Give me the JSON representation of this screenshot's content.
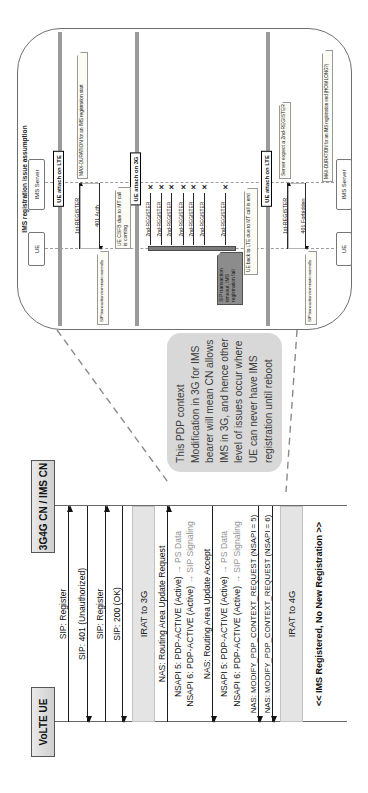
{
  "colors": {
    "callout_bg": "#d8d8d8",
    "band_bg": "#e4e4e4",
    "phase_bar": "#9a9a9a",
    "dark_note_bg": "#8c8c8c",
    "note_bg": "#fcfcf4",
    "text": "#111111",
    "muted_text": "#939393"
  },
  "main": {
    "participants": [
      {
        "label": "VoLTE UE"
      },
      {
        "label": "3G4G CN / IMS CN"
      }
    ],
    "messages": [
      {
        "label": "SIP: Register",
        "dir": "right",
        "type": "arrow"
      },
      {
        "label": "SIP: 401 (Unauthorized)",
        "dir": "left",
        "type": "arrow"
      },
      {
        "label": "SIP: Register",
        "dir": "right",
        "type": "arrow"
      },
      {
        "label": "SIP: 200 (OK)",
        "dir": "left",
        "type": "arrow"
      },
      {
        "label": "IRAT to 3G",
        "type": "band"
      },
      {
        "label": "NAS: Routing Area Update Request",
        "dir": "right",
        "type": "arrow"
      },
      {
        "label": "NSAPI 5: PDP-ACTIVE (Active)",
        "suffix": "→ PS Data",
        "type": "text"
      },
      {
        "label": "NSAPI 6: PDP-ACTIVE (Active)",
        "suffix": "→ SIP Signaling",
        "type": "text"
      },
      {
        "label": "NAS: Routing Area Update Accept",
        "dir": "left",
        "type": "arrow"
      },
      {
        "label": "NSAPI 5: PDP-ACTIVE (Active)",
        "suffix": "→ PS Data",
        "type": "text"
      },
      {
        "label": "NSAPI 6: PDP-ACTIVE (Active)",
        "suffix": "→ SIP Signaling",
        "type": "text"
      },
      {
        "label": "NAS: MODIFY_PDP_CONTEXT_REQUEST (NSAPI = 5)",
        "dir": "left",
        "type": "arrow"
      },
      {
        "label": "NAS: MODIFY_PDP_CONTEXT_REQUEST (NSAPI = 6)",
        "dir": "left",
        "type": "arrow"
      },
      {
        "label": "IRAT to 4G",
        "type": "band"
      },
      {
        "label": "<< IMS Registered, No New Registration >>",
        "type": "text-center"
      }
    ]
  },
  "callout": {
    "lines": [
      "This PDP context",
      "Modification in 3G for IMS",
      "bearer will mean CN allows",
      "IMS in 3G, and hence other",
      "level of issues occur where",
      "UE can never have IMS",
      "registration until reboot"
    ]
  },
  "inset": {
    "title": "IMS registration issue assumption",
    "participants": [
      {
        "label": "UE"
      },
      {
        "label": "IMS Server"
      }
    ],
    "phases": [
      {
        "label": "UE attach on LTE"
      },
      {
        "label": "UE attach on 3G"
      },
      {
        "label": "UE attach on LTE"
      }
    ],
    "labels": {
      "first_register": "1st-REGISTER",
      "auth_401": "401 Auth",
      "forbidden_401": "401 Forbidden",
      "second_register": "2nd-REGISTER",
      "fail_mark": "✕"
    },
    "notes": {
      "max_duration_start": "MAX-DURATION for an IMS registration start",
      "max_duration_end": "MAX-DURATION for an IMS registration end (HOW LONG?)",
      "terminate_normally": "SIP transaction terminate normally",
      "csfb": "UE CSFB due to MT call is coming",
      "timeout_fail": "SIP transaction timeout, IMS registration fail",
      "back_to_lte": "UE back to LTE due to MT call is end",
      "server_expect": "Server expect a 2nd-REGISTER"
    }
  }
}
